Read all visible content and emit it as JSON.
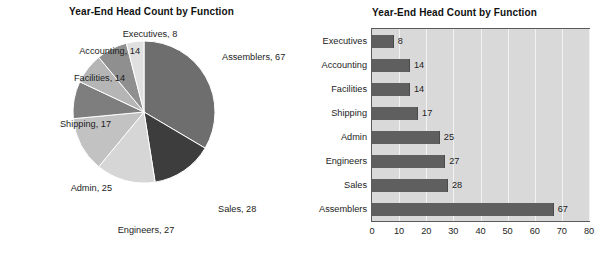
{
  "chart_data": [
    {
      "type": "pie",
      "title": "Year-End Head Count by Function",
      "xlabel": "",
      "ylabel": "",
      "grid": false,
      "legend_position": "none",
      "label_format": "{name}, {value}",
      "categories": [
        "Assemblers",
        "Sales",
        "Engineers",
        "Admin",
        "Shipping",
        "Facilities",
        "Accounting",
        "Executives"
      ],
      "values": [
        67,
        28,
        27,
        25,
        17,
        14,
        14,
        8
      ],
      "total": 200,
      "slices": [
        {
          "name": "Assemblers",
          "value": 67,
          "label": "Assemblers, 67",
          "color": "#6e6e6e"
        },
        {
          "name": "Sales",
          "value": 28,
          "label": "Sales, 28",
          "color": "#3d3d3d"
        },
        {
          "name": "Engineers",
          "value": 27,
          "label": "Engineers, 27",
          "color": "#d6d6d6"
        },
        {
          "name": "Admin",
          "value": 25,
          "label": "Admin, 25",
          "color": "#c2c2c2"
        },
        {
          "name": "Shipping",
          "value": 17,
          "label": "Shipping, 17",
          "color": "#7e7e7e"
        },
        {
          "name": "Facilities",
          "value": 14,
          "label": "Facilities, 14",
          "color": "#b5b5b5"
        },
        {
          "name": "Accounting",
          "value": 14,
          "label": "Accounting, 14",
          "color": "#8f8f8f"
        },
        {
          "name": "Executives",
          "value": 8,
          "label": "Executives, 8",
          "color": "#e0e0e0"
        }
      ]
    },
    {
      "type": "bar",
      "orientation": "horizontal",
      "title": "Year-End Head Count by Function",
      "xlabel": "",
      "ylabel": "",
      "grid": true,
      "legend_position": "none",
      "xlim": [
        0,
        80
      ],
      "x_ticks": [
        "0",
        "10",
        "20",
        "30",
        "40",
        "50",
        "60",
        "70",
        "80"
      ],
      "categories": [
        "Executives",
        "Accounting",
        "Facilities",
        "Shipping",
        "Admin",
        "Engineers",
        "Sales",
        "Assemblers"
      ],
      "values": [
        8,
        14,
        14,
        17,
        25,
        27,
        28,
        67
      ],
      "value_labels": [
        "8",
        "14",
        "14",
        "17",
        "25",
        "27",
        "28",
        "67"
      ],
      "bar_color": "#5f5f5f",
      "plot_background": "#d9d9d9",
      "gridline_color": "#f2f2f2",
      "axis_color": "#5a5a5a"
    }
  ]
}
